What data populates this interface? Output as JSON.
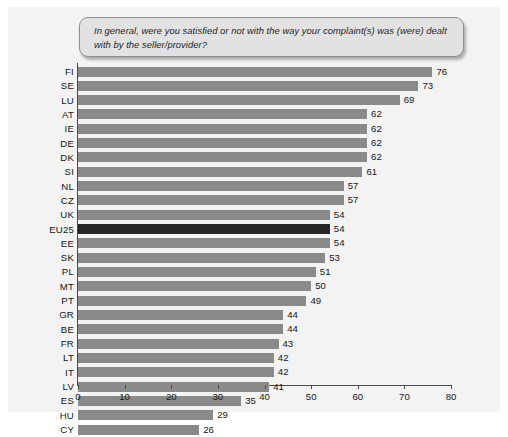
{
  "chart_data": {
    "type": "bar",
    "orientation": "horizontal",
    "title": "In general, were you satisfied or not with the way your complaint(s) was (were) dealt with by the seller/provider?",
    "xlabel": "",
    "ylabel": "",
    "xlim": [
      0,
      80
    ],
    "xticks": [
      0,
      10,
      20,
      30,
      40,
      50,
      60,
      70,
      80
    ],
    "grid": false,
    "legend": null,
    "bar_color": "#8a8a8a",
    "highlight_color": "#262626",
    "highlight_category": "EU25",
    "categories": [
      "FI",
      "SE",
      "LU",
      "AT",
      "IE",
      "DE",
      "DK",
      "SI",
      "NL",
      "CZ",
      "UK",
      "EU25",
      "EE",
      "SK",
      "PL",
      "MT",
      "PT",
      "GR",
      "BE",
      "FR",
      "LT",
      "IT",
      "LV",
      "ES",
      "HU",
      "CY"
    ],
    "values": [
      76,
      73,
      69,
      62,
      62,
      62,
      62,
      61,
      57,
      57,
      54,
      54,
      54,
      53,
      51,
      50,
      49,
      44,
      44,
      43,
      42,
      42,
      41,
      35,
      29,
      26
    ]
  }
}
